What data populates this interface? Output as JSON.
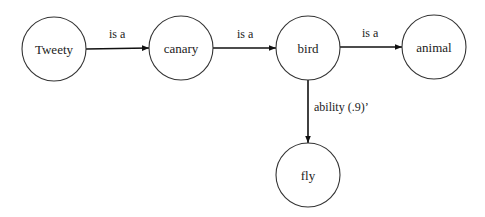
{
  "diagram": {
    "type": "semantic-network",
    "nodes": [
      {
        "id": "tweety",
        "label": "Tweety",
        "cx": 54,
        "cy": 49,
        "r": 32
      },
      {
        "id": "canary",
        "label": "canary",
        "cx": 181,
        "cy": 48,
        "r": 32
      },
      {
        "id": "bird",
        "label": "bird",
        "cx": 308,
        "cy": 48,
        "r": 32
      },
      {
        "id": "animal",
        "label": "animal",
        "cx": 434,
        "cy": 47,
        "r": 32
      },
      {
        "id": "fly",
        "label": "fly",
        "cx": 308,
        "cy": 175,
        "r": 32
      }
    ],
    "edges": [
      {
        "from": "tweety",
        "to": "canary",
        "label": "is a"
      },
      {
        "from": "canary",
        "to": "bird",
        "label": "is a"
      },
      {
        "from": "bird",
        "to": "animal",
        "label": "is a"
      },
      {
        "from": "bird",
        "to": "fly",
        "label": "ability (.9)ʼ"
      }
    ],
    "colors": {
      "node_stroke": "#333333",
      "edge": "#111111",
      "text": "#222222",
      "background": "#ffffff"
    }
  }
}
